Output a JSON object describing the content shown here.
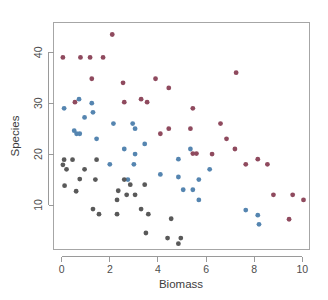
{
  "chart_data": {
    "type": "scatter",
    "title": "",
    "xlabel": "Biomass",
    "ylabel": "Species",
    "xlim": [
      -0.35,
      10.35
    ],
    "ylim": [
      1.0,
      45.0
    ],
    "xticks": [
      0,
      2,
      4,
      6,
      8,
      10
    ],
    "yticks": [
      10,
      20,
      30,
      40
    ],
    "xtick_labels": [
      "0",
      "2",
      "4",
      "6",
      "8",
      "10"
    ],
    "ytick_labels": [
      "10",
      "20",
      "30",
      "40"
    ],
    "grid": false,
    "legend": "none",
    "point_radius_px": 2.4,
    "colors": {
      "high": "#8f4a5e",
      "mid": "#5585b0",
      "low": "#595959",
      "axis": "#9a9a9a",
      "frame": "#a6a6a6",
      "text": "#4d4d4d",
      "background": "#ffffff"
    },
    "series": [
      {
        "name": "high",
        "color": "#8f4a5e",
        "points": [
          [
            2.1,
            43.5
          ],
          [
            0.05,
            39.0
          ],
          [
            0.78,
            39.0
          ],
          [
            1.18,
            39.0
          ],
          [
            1.72,
            39.0
          ],
          [
            7.25,
            36.0
          ],
          [
            1.25,
            34.8
          ],
          [
            3.9,
            34.8
          ],
          [
            2.55,
            34.0
          ],
          [
            4.45,
            33.0
          ],
          [
            0.55,
            30.2
          ],
          [
            2.6,
            30.2
          ],
          [
            3.3,
            30.8
          ],
          [
            3.55,
            30.2
          ],
          [
            5.45,
            29.0
          ],
          [
            6.6,
            26.0
          ],
          [
            4.45,
            25.0
          ],
          [
            5.35,
            25.0
          ],
          [
            4.1,
            24.0
          ],
          [
            6.85,
            23.0
          ],
          [
            7.2,
            21.0
          ],
          [
            5.45,
            20.1
          ],
          [
            5.6,
            20.1
          ],
          [
            6.25,
            20.0
          ],
          [
            8.15,
            19.0
          ],
          [
            7.65,
            18.0
          ],
          [
            8.55,
            18.0
          ],
          [
            8.8,
            12.0
          ],
          [
            9.6,
            12.0
          ],
          [
            10.05,
            11.0
          ],
          [
            9.45,
            7.2
          ]
        ]
      },
      {
        "name": "mid",
        "color": "#5585b0",
        "points": [
          [
            0.72,
            30.8
          ],
          [
            0.1,
            29.0
          ],
          [
            1.25,
            30.0
          ],
          [
            1.3,
            28.2
          ],
          [
            0.95,
            27.2
          ],
          [
            0.52,
            24.6
          ],
          [
            0.62,
            24.0
          ],
          [
            0.75,
            24.0
          ],
          [
            2.15,
            26.0
          ],
          [
            2.95,
            26.0
          ],
          [
            3.05,
            25.0
          ],
          [
            1.45,
            23.0
          ],
          [
            2.6,
            21.0
          ],
          [
            3.05,
            20.0
          ],
          [
            3.45,
            22.0
          ],
          [
            4.85,
            19.0
          ],
          [
            5.35,
            21.0
          ],
          [
            2.0,
            18.0
          ],
          [
            3.0,
            18.0
          ],
          [
            6.15,
            17.0
          ],
          [
            4.1,
            16.0
          ],
          [
            4.85,
            15.5
          ],
          [
            5.7,
            15.0
          ],
          [
            2.75,
            15.0
          ],
          [
            5.05,
            13.0
          ],
          [
            5.45,
            13.0
          ],
          [
            5.7,
            11.0
          ],
          [
            7.65,
            9.0
          ],
          [
            8.15,
            8.0
          ],
          [
            8.2,
            6.2
          ]
        ]
      },
      {
        "name": "low",
        "color": "#595959",
        "points": [
          [
            0.1,
            18.9
          ],
          [
            0.05,
            17.9
          ],
          [
            0.45,
            18.9
          ],
          [
            0.2,
            17.0
          ],
          [
            1.45,
            18.9
          ],
          [
            0.12,
            13.8
          ],
          [
            0.6,
            12.7
          ],
          [
            0.75,
            15.1
          ],
          [
            0.95,
            17.0
          ],
          [
            1.4,
            15.0
          ],
          [
            2.6,
            15.0
          ],
          [
            2.85,
            14.0
          ],
          [
            3.45,
            14.0
          ],
          [
            2.35,
            12.8
          ],
          [
            2.7,
            12.0
          ],
          [
            3.05,
            12.0
          ],
          [
            2.3,
            11.0
          ],
          [
            1.3,
            9.2
          ],
          [
            1.55,
            8.2
          ],
          [
            2.3,
            8.2
          ],
          [
            3.3,
            9.2
          ],
          [
            3.6,
            8.2
          ],
          [
            4.55,
            7.3
          ],
          [
            3.5,
            4.5
          ],
          [
            4.4,
            3.5
          ],
          [
            4.95,
            3.5
          ],
          [
            4.85,
            2.4
          ]
        ]
      }
    ]
  },
  "axes": {
    "x_axis_label": "Biomass",
    "y_axis_label": "Species"
  }
}
